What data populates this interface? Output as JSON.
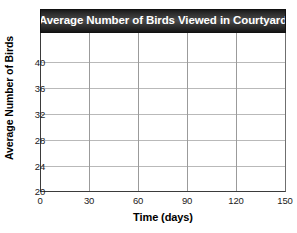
{
  "chart_data": {
    "type": "line",
    "title": "Average Number of Birds Viewed in Courtyard",
    "xlabel": "Time (days)",
    "ylabel": "Average Number of Birds",
    "x_ticks": [
      0,
      30,
      60,
      90,
      120,
      150
    ],
    "y_ticks": [
      20,
      24,
      28,
      32,
      36,
      40
    ],
    "xlim": [
      0,
      150
    ],
    "ylim": [
      20,
      42
    ],
    "series": [],
    "values": [],
    "categories": [],
    "grid": "both",
    "legend": "none",
    "note": "Empty grid template - no data plotted"
  },
  "figure": {
    "title": "Average Number of Birds Viewed in Courtyard",
    "x_axis_title": "Time (days)",
    "y_axis_title": "Average Number of Birds",
    "x_tick_labels": [
      "0",
      "30",
      "60",
      "90",
      "120",
      "150"
    ],
    "y_tick_labels": [
      "20",
      "24",
      "28",
      "32",
      "36",
      "40"
    ]
  },
  "colors": {
    "title_bar_dark": "#191919",
    "title_bar_light": "#4a4a4a",
    "title_text": "#ffffff",
    "axis_line": "#3b3b3b",
    "grid_line": "#b9b9b9",
    "plot_background": "#ffffff",
    "page_background": "#ffffff",
    "tick_text": "#1a1a1a"
  }
}
